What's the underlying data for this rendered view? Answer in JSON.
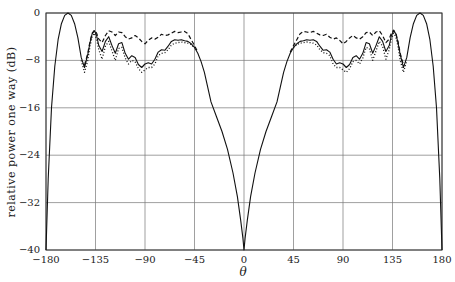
{
  "chart_data": {
    "type": "line",
    "title": "",
    "xlabel": "θ",
    "ylabel": "relative power one way (dB)",
    "xlim": [
      -180,
      180
    ],
    "ylim": [
      -40,
      0
    ],
    "xticks": [
      -180,
      -135,
      -90,
      -45,
      0,
      45,
      90,
      135,
      180
    ],
    "yticks": [
      0,
      -8,
      -16,
      -24,
      -32,
      -40
    ],
    "xtick_labels": [
      "−180",
      "−135",
      "−90",
      "−45",
      "0",
      "45",
      "90",
      "135",
      "180"
    ],
    "ytick_labels": [
      "0",
      "−8",
      "−16",
      "−24",
      "−32",
      "−40"
    ],
    "grid": true,
    "legend": null,
    "series": [
      {
        "name": "solid",
        "style": "solid",
        "x": [
          -180,
          -178,
          -175,
          -172,
          -169,
          -166,
          -163,
          -160,
          -157,
          -154,
          -151,
          -148,
          -145,
          -142,
          -140,
          -138,
          -136,
          -134,
          -132,
          -129,
          -126,
          -123,
          -120,
          -117,
          -114,
          -111,
          -108,
          -105,
          -102,
          -99,
          -96,
          -93,
          -90,
          -87,
          -84,
          -81,
          -78,
          -75,
          -72,
          -69,
          -66,
          -63,
          -60,
          -57,
          -54,
          -51,
          -48,
          -45,
          -42,
          -39,
          -36,
          -33,
          -30,
          -25,
          -20,
          -15,
          -10,
          -6,
          -3,
          -1,
          0,
          1,
          3,
          6,
          10,
          15,
          20,
          25,
          30,
          33,
          36,
          39,
          42,
          45,
          48,
          51,
          54,
          57,
          60,
          63,
          66,
          69,
          72,
          75,
          78,
          81,
          84,
          87,
          90,
          93,
          96,
          99,
          102,
          105,
          108,
          111,
          114,
          117,
          120,
          123,
          126,
          129,
          132,
          134,
          136,
          138,
          140,
          142,
          145,
          148,
          151,
          154,
          157,
          160,
          163,
          166,
          169,
          172,
          175,
          178,
          180
        ],
        "y": [
          -40,
          -28,
          -16,
          -9,
          -4.5,
          -1.8,
          -0.4,
          0,
          -0.4,
          -1.8,
          -4.2,
          -7.5,
          -9.2,
          -7,
          -5,
          -3.5,
          -3,
          -3.8,
          -5.5,
          -6.5,
          -4.8,
          -4,
          -5.5,
          -6.8,
          -5.2,
          -5,
          -6.8,
          -7.8,
          -7.2,
          -7.5,
          -8.7,
          -9.2,
          -8.6,
          -8.4,
          -8.6,
          -7.8,
          -6.6,
          -6.2,
          -6.3,
          -5.6,
          -4.8,
          -4.5,
          -4.6,
          -4.5,
          -4.7,
          -4.8,
          -5.2,
          -5.8,
          -6.8,
          -8.2,
          -10,
          -12.5,
          -15,
          -17.5,
          -20,
          -23,
          -27,
          -31,
          -35,
          -38,
          -40,
          -38,
          -35,
          -31,
          -27,
          -23,
          -20,
          -17.5,
          -15,
          -12.5,
          -10,
          -8.2,
          -6.8,
          -5.8,
          -5.2,
          -4.8,
          -4.7,
          -4.5,
          -4.6,
          -4.5,
          -4.8,
          -5.6,
          -6.3,
          -6.2,
          -6.6,
          -7.8,
          -8.6,
          -8.4,
          -8.6,
          -9.2,
          -8.7,
          -7.5,
          -7.2,
          -7.8,
          -6.8,
          -5,
          -5.2,
          -6.8,
          -5.5,
          -4,
          -4.8,
          -6.5,
          -5.5,
          -3.8,
          -3,
          -3.5,
          -5,
          -7,
          -9.2,
          -7.5,
          -4.2,
          -1.8,
          -0.4,
          0,
          -0.4,
          -1.8,
          -4.5,
          -9,
          -16,
          -28,
          -40
        ]
      },
      {
        "name": "dashed",
        "style": "dashed",
        "x": [
          -145,
          -142,
          -140,
          -138,
          -136,
          -134,
          -132,
          -129,
          -126,
          -123,
          -120,
          -117,
          -114,
          -111,
          -108,
          -105,
          -102,
          -99,
          -96,
          -93,
          -90,
          -87,
          -84,
          -81,
          -78,
          -75,
          -72,
          -69,
          -66,
          -63,
          -60,
          -57,
          -54,
          -51,
          -48,
          -45,
          -42,
          42,
          45,
          48,
          51,
          54,
          57,
          60,
          63,
          66,
          69,
          72,
          75,
          78,
          81,
          84,
          87,
          90,
          93,
          96,
          99,
          102,
          105,
          108,
          111,
          114,
          117,
          120,
          123,
          126,
          129,
          132,
          134,
          136,
          138,
          140,
          142,
          145
        ],
        "y": [
          -8.8,
          -6.8,
          -4.8,
          -3.4,
          -2.9,
          -3.4,
          -4.4,
          -5,
          -3.8,
          -3,
          -3.2,
          -3.8,
          -3.2,
          -3.3,
          -4,
          -4.4,
          -4.2,
          -3.8,
          -4.2,
          -4.8,
          -5.2,
          -4.6,
          -4.2,
          -4.4,
          -4.1,
          -3.6,
          -3.8,
          -3.7,
          -3.4,
          -3.1,
          -3.3,
          -3.2,
          -3.1,
          -3.5,
          -4.5,
          -5.5,
          -6.6,
          -6.6,
          -5.5,
          -4.5,
          -3.5,
          -3.1,
          -3.2,
          -3.3,
          -3.1,
          -3.4,
          -3.7,
          -3.8,
          -3.6,
          -4.1,
          -4.4,
          -4.2,
          -4.6,
          -5.2,
          -4.8,
          -4.2,
          -3.8,
          -4.2,
          -4.4,
          -4,
          -3.3,
          -3.2,
          -3.8,
          -3.2,
          -3,
          -3.8,
          -5,
          -4.4,
          -3.4,
          -2.9,
          -3.4,
          -4.8,
          -6.8,
          -8.8
        ]
      },
      {
        "name": "dotted",
        "style": "dotted",
        "x": [
          -148,
          -145,
          -142,
          -140,
          -138,
          -136,
          -134,
          -132,
          -129,
          -126,
          -123,
          -120,
          -117,
          -114,
          -111,
          -108,
          -105,
          -102,
          -99,
          -96,
          -93,
          -90,
          -87,
          -84,
          -81,
          -78,
          -75,
          -72,
          -69,
          -66,
          -63,
          -60,
          -57,
          -54,
          -51,
          -48,
          -45,
          45,
          48,
          51,
          54,
          57,
          60,
          63,
          66,
          69,
          72,
          75,
          78,
          81,
          84,
          87,
          90,
          93,
          96,
          99,
          102,
          105,
          108,
          111,
          114,
          117,
          120,
          123,
          126,
          129,
          132,
          134,
          136,
          138,
          140,
          142,
          145,
          148
        ],
        "y": [
          -8,
          -10,
          -8,
          -5.6,
          -4,
          -3.4,
          -4.4,
          -6.2,
          -7.8,
          -5.6,
          -4.8,
          -6.4,
          -8,
          -6,
          -5.8,
          -7.6,
          -8.6,
          -8,
          -8.2,
          -9.4,
          -10,
          -9.6,
          -9.2,
          -9.2,
          -8.6,
          -7.2,
          -6.8,
          -6.7,
          -6.2,
          -5.4,
          -5.1,
          -5,
          -4.9,
          -5,
          -5.1,
          -5.3,
          -5.9,
          -5.9,
          -5.3,
          -5.1,
          -5,
          -4.9,
          -5,
          -5.1,
          -5.4,
          -6.2,
          -6.7,
          -6.8,
          -7.2,
          -8.6,
          -9.2,
          -9.2,
          -9.6,
          -10,
          -9.4,
          -8.2,
          -8,
          -8.6,
          -7.6,
          -5.8,
          -6,
          -8,
          -6.4,
          -4.8,
          -5.6,
          -7.8,
          -6.2,
          -4.4,
          -3.4,
          -4,
          -5.6,
          -8,
          -10,
          -8
        ]
      }
    ]
  },
  "axes": {
    "xlabel": "θ",
    "ylabel": "relative power one way (dB)",
    "xtick_labels": [
      "−180",
      "−135",
      "−90",
      "−45",
      "0",
      "45",
      "90",
      "135",
      "180"
    ],
    "ytick_labels": [
      "0",
      "−8",
      "−16",
      "−24",
      "−32",
      "−40"
    ]
  }
}
